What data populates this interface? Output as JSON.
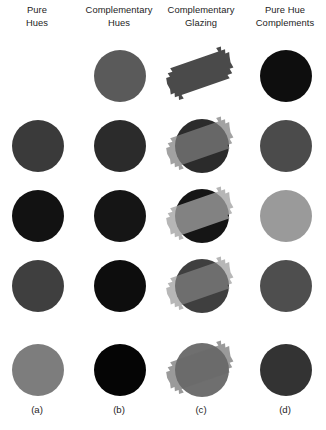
{
  "figure": {
    "background_color": "#ffffff",
    "text_color": "#1d1d1d",
    "columns": 4,
    "rows": 5
  },
  "headers": [
    {
      "line1": "Pure",
      "line2": "Hues"
    },
    {
      "line1": "Complementary",
      "line2": "Hues"
    },
    {
      "line1": "Complementary",
      "line2": "Glazing"
    },
    {
      "line1": "Pure Hue",
      "line2": "Complements"
    }
  ],
  "footers": [
    {
      "label": "(a)"
    },
    {
      "label": "(b)"
    },
    {
      "label": "(c)"
    },
    {
      "label": "(d)"
    }
  ],
  "chart_data": {
    "type": "table",
    "columns": [
      "Pure Hues",
      "Complementary Hues",
      "Complementary Glazing",
      "Pure Hue Complements"
    ],
    "column_keys": [
      "(a)",
      "(b)",
      "(c)",
      "(d)"
    ],
    "row_count": 5,
    "swatch_shape": "circle",
    "glaze_shape": "diagonal-brush-stroke",
    "cells": [
      {
        "row": 1,
        "a": {
          "present": false,
          "color": null
        },
        "b": {
          "present": true,
          "color": "#5a5a5a"
        },
        "c": {
          "present": false,
          "disc_color": null,
          "glaze_color": "#4a4a4a",
          "glaze_opacity": 1.0
        },
        "d": {
          "present": true,
          "color": "#0e0e0e"
        }
      },
      {
        "row": 2,
        "a": {
          "present": true,
          "color": "#3a3a3a"
        },
        "b": {
          "present": true,
          "color": "#2b2b2b"
        },
        "c": {
          "present": true,
          "disc_color": "#2b2b2b",
          "glaze_color": "#7e7e7e",
          "glaze_opacity": 0.72
        },
        "d": {
          "present": true,
          "color": "#4b4b4b"
        }
      },
      {
        "row": 3,
        "a": {
          "present": true,
          "color": "#121212"
        },
        "b": {
          "present": true,
          "color": "#151515"
        },
        "c": {
          "present": true,
          "disc_color": "#151515",
          "glaze_color": "#a2a2a2",
          "glaze_opacity": 0.78
        },
        "d": {
          "present": true,
          "color": "#9a9a9a"
        }
      },
      {
        "row": 4,
        "a": {
          "present": true,
          "color": "#3f3f3f"
        },
        "b": {
          "present": true,
          "color": "#0d0d0d"
        },
        "c": {
          "present": true,
          "disc_color": "#3f3f3f",
          "glaze_color": "#8a8a8a",
          "glaze_opacity": 0.62
        },
        "d": {
          "present": true,
          "color": "#4e4e4e"
        }
      },
      {
        "row": 5,
        "a": {
          "present": true,
          "color": "#7d7d7d"
        },
        "b": {
          "present": true,
          "color": "#050505"
        },
        "c": {
          "present": true,
          "disc_color": "#6f6f6f",
          "glaze_color": "#6a6a6a",
          "glaze_opacity": 0.68
        },
        "d": {
          "present": true,
          "color": "#333333"
        }
      }
    ]
  }
}
